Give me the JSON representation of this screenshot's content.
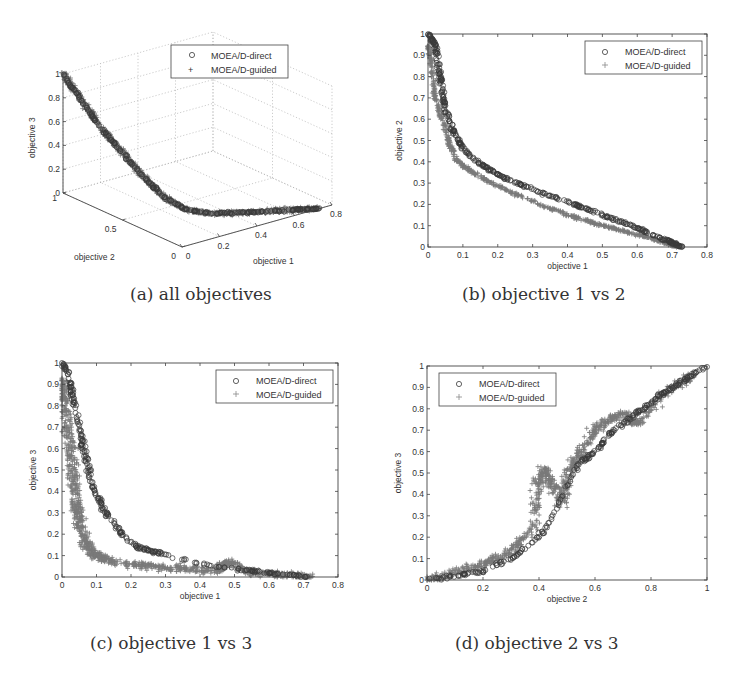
{
  "figure": {
    "captions": {
      "a": "(a) all objectives",
      "b": "(b) objective 1 vs 2",
      "c": "(c) objective 1 vs 3",
      "d": "(d) objective 2 vs 3"
    },
    "colors": {
      "direct": "#3a3a3a",
      "guided": "#7a7a7a",
      "axis": "#444444",
      "grid": "#aaaaaa",
      "text": "#333333"
    }
  },
  "chart_data": [
    {
      "id": "a",
      "type": "scatter",
      "projection": "3d",
      "title": "(a) all objectives",
      "xlabel": "objective 1",
      "ylabel": "objective 2",
      "zlabel": "objective 3",
      "xticks": [
        "0",
        "0.2",
        "0.4",
        "0.6",
        "0.8"
      ],
      "yticks": [
        "0",
        "0.5",
        "1"
      ],
      "zticks": [
        "0",
        "0.2",
        "0.4",
        "0.6",
        "0.8",
        "1"
      ],
      "xlim": [
        0,
        0.8
      ],
      "ylim": [
        0,
        1
      ],
      "zlim": [
        0,
        1
      ],
      "grid": true,
      "legend": {
        "position": "top-right",
        "entries": [
          {
            "marker": "o",
            "label": "MOEA/D-direct"
          },
          {
            "marker": "+",
            "label": "MOEA/D-guided"
          }
        ]
      },
      "series": [
        {
          "name": "MOEA/D-direct",
          "marker": "o",
          "description": "Pareto front points on a curved surface from (0,1,1) down to (0.73,0,0)"
        },
        {
          "name": "MOEA/D-guided",
          "marker": "+",
          "description": "Dense cloud overlapping direct, same front"
        }
      ]
    },
    {
      "id": "b",
      "type": "scatter",
      "title": "(b) objective 1 vs 2",
      "xlabel": "objective 1",
      "ylabel": "objective 2",
      "xticks": [
        "0",
        "0.1",
        "0.2",
        "0.3",
        "0.4",
        "0.5",
        "0.6",
        "0.7",
        "0.8"
      ],
      "yticks": [
        "0",
        "0.1",
        "0.2",
        "0.3",
        "0.4",
        "0.5",
        "0.6",
        "0.7",
        "0.8",
        "0.9",
        "1"
      ],
      "xlim": [
        0,
        0.8
      ],
      "ylim": [
        0,
        1
      ],
      "grid": false,
      "legend": {
        "position": "top-right",
        "entries": [
          {
            "marker": "o",
            "label": "MOEA/D-direct"
          },
          {
            "marker": "+",
            "label": "MOEA/D-guided"
          }
        ]
      },
      "series": [
        {
          "name": "MOEA/D-direct",
          "marker": "o",
          "points": [
            [
              0.0,
              1.0
            ],
            [
              0.02,
              0.95
            ],
            [
              0.03,
              0.85
            ],
            [
              0.04,
              0.75
            ],
            [
              0.05,
              0.65
            ],
            [
              0.07,
              0.55
            ],
            [
              0.1,
              0.46
            ],
            [
              0.15,
              0.39
            ],
            [
              0.2,
              0.34
            ],
            [
              0.27,
              0.29
            ],
            [
              0.35,
              0.24
            ],
            [
              0.42,
              0.2
            ],
            [
              0.5,
              0.15
            ],
            [
              0.57,
              0.11
            ],
            [
              0.63,
              0.07
            ],
            [
              0.7,
              0.02
            ],
            [
              0.73,
              0.0
            ]
          ]
        },
        {
          "name": "MOEA/D-guided",
          "marker": "+",
          "points": [
            [
              0.0,
              0.95
            ],
            [
              0.01,
              0.85
            ],
            [
              0.02,
              0.7
            ],
            [
              0.04,
              0.6
            ],
            [
              0.06,
              0.5
            ],
            [
              0.08,
              0.41
            ],
            [
              0.12,
              0.36
            ],
            [
              0.18,
              0.3
            ],
            [
              0.25,
              0.25
            ],
            [
              0.32,
              0.2
            ],
            [
              0.4,
              0.15
            ],
            [
              0.48,
              0.11
            ],
            [
              0.55,
              0.08
            ],
            [
              0.62,
              0.05
            ],
            [
              0.68,
              0.02
            ],
            [
              0.72,
              0.0
            ]
          ]
        }
      ]
    },
    {
      "id": "c",
      "type": "scatter",
      "title": "(c) objective 1 vs 3",
      "xlabel": "objective 1",
      "ylabel": "objective 3",
      "xticks": [
        "0",
        "0.1",
        "0.2",
        "0.3",
        "0.4",
        "0.5",
        "0.6",
        "0.7",
        "0.8"
      ],
      "yticks": [
        "0",
        "0.1",
        "0.2",
        "0.3",
        "0.4",
        "0.5",
        "0.6",
        "0.7",
        "0.8",
        "0.9",
        "1"
      ],
      "xlim": [
        0,
        0.8
      ],
      "ylim": [
        0,
        1
      ],
      "grid": false,
      "legend": {
        "position": "top-right",
        "entries": [
          {
            "marker": "o",
            "label": "MOEA/D-direct"
          },
          {
            "marker": "+",
            "label": "MOEA/D-guided"
          }
        ]
      },
      "series": [
        {
          "name": "MOEA/D-direct",
          "marker": "o",
          "points": [
            [
              0.0,
              1.0
            ],
            [
              0.02,
              0.95
            ],
            [
              0.03,
              0.85
            ],
            [
              0.05,
              0.7
            ],
            [
              0.06,
              0.62
            ],
            [
              0.07,
              0.55
            ],
            [
              0.09,
              0.42
            ],
            [
              0.12,
              0.32
            ],
            [
              0.15,
              0.25
            ],
            [
              0.18,
              0.19
            ],
            [
              0.22,
              0.14
            ],
            [
              0.26,
              0.12
            ],
            [
              0.29,
              0.11
            ],
            [
              0.4,
              0.06
            ],
            [
              0.5,
              0.04
            ],
            [
              0.6,
              0.02
            ],
            [
              0.73,
              0.0
            ]
          ]
        },
        {
          "name": "MOEA/D-guided",
          "marker": "+",
          "points": [
            [
              0.0,
              0.92
            ],
            [
              0.01,
              0.8
            ],
            [
              0.02,
              0.65
            ],
            [
              0.03,
              0.5
            ],
            [
              0.04,
              0.35
            ],
            [
              0.05,
              0.25
            ],
            [
              0.07,
              0.15
            ],
            [
              0.1,
              0.1
            ],
            [
              0.15,
              0.07
            ],
            [
              0.25,
              0.05
            ],
            [
              0.35,
              0.04
            ],
            [
              0.45,
              0.03
            ],
            [
              0.48,
              0.07
            ],
            [
              0.55,
              0.02
            ],
            [
              0.65,
              0.01
            ],
            [
              0.72,
              0.0
            ]
          ]
        }
      ]
    },
    {
      "id": "d",
      "type": "scatter",
      "title": "(d) objective 2 vs 3",
      "xlabel": "objective 2",
      "ylabel": "objective 3",
      "xticks": [
        "0",
        "0.2",
        "0.4",
        "0.6",
        "0.8",
        "1"
      ],
      "yticks": [
        "0",
        "0.1",
        "0.2",
        "0.3",
        "0.4",
        "0.5",
        "0.6",
        "0.7",
        "0.8",
        "0.9",
        "1"
      ],
      "xlim": [
        0,
        1
      ],
      "ylim": [
        0,
        1
      ],
      "grid": false,
      "legend": {
        "position": "top-left",
        "entries": [
          {
            "marker": "o",
            "label": "MOEA/D-direct"
          },
          {
            "marker": "+",
            "label": "MOEA/D-guided"
          }
        ]
      },
      "series": [
        {
          "name": "MOEA/D-direct",
          "marker": "o",
          "points": [
            [
              0.0,
              0.0
            ],
            [
              0.1,
              0.02
            ],
            [
              0.2,
              0.04
            ],
            [
              0.3,
              0.1
            ],
            [
              0.4,
              0.2
            ],
            [
              0.45,
              0.3
            ],
            [
              0.5,
              0.45
            ],
            [
              0.55,
              0.55
            ],
            [
              0.6,
              0.6
            ],
            [
              0.65,
              0.68
            ],
            [
              0.7,
              0.73
            ],
            [
              0.75,
              0.78
            ],
            [
              0.8,
              0.83
            ],
            [
              0.85,
              0.88
            ],
            [
              0.9,
              0.92
            ],
            [
              0.95,
              0.96
            ],
            [
              1.0,
              1.0
            ]
          ]
        },
        {
          "name": "MOEA/D-guided",
          "marker": "+",
          "points": [
            [
              0.0,
              0.0
            ],
            [
              0.1,
              0.04
            ],
            [
              0.2,
              0.07
            ],
            [
              0.3,
              0.13
            ],
            [
              0.38,
              0.25
            ],
            [
              0.4,
              0.45
            ],
            [
              0.42,
              0.52
            ],
            [
              0.48,
              0.35
            ],
            [
              0.5,
              0.5
            ],
            [
              0.55,
              0.6
            ],
            [
              0.6,
              0.7
            ],
            [
              0.65,
              0.75
            ],
            [
              0.7,
              0.78
            ],
            [
              0.75,
              0.73
            ],
            [
              0.85,
              0.88
            ],
            [
              0.95,
              0.95
            ]
          ]
        }
      ]
    }
  ]
}
